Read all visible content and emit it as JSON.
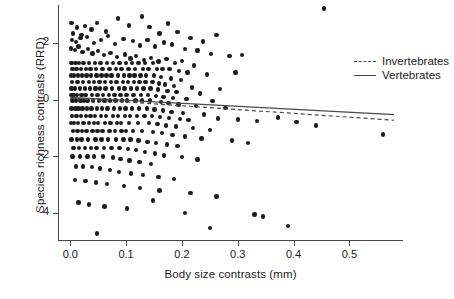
{
  "chart_data": {
    "type": "scatter",
    "title": "",
    "xlabel": "Body size contrasts (mm)",
    "ylabel": "Species richness contrasts (RRD)",
    "xlim": [
      -0.022,
      0.596
    ],
    "ylim": [
      -4.95,
      3.35
    ],
    "xticks": [
      0.0,
      0.1,
      0.2,
      0.3,
      0.4,
      0.5
    ],
    "xtick_labels": [
      "0.0",
      "0.1",
      "0.2",
      "0.3",
      "0.4",
      "0.5"
    ],
    "yticks": [
      2,
      0,
      -2,
      -4
    ],
    "ytick_labels": [
      "2",
      "0",
      "-2",
      "-4"
    ],
    "grid": false,
    "legend_position": "top-right",
    "point_color": "#1c1c1c",
    "axis_color": "#4a4a4a",
    "legend": [
      {
        "name": "Invertebrates",
        "style": "dashed"
      },
      {
        "name": "Vertebrates",
        "style": "solid"
      }
    ],
    "series": [
      {
        "name": "Invertebrates",
        "type": "line",
        "style": "dashed",
        "x": [
          0.0,
          0.58
        ],
        "y": [
          0.06,
          -0.72
        ]
      },
      {
        "name": "Vertebrates",
        "type": "line",
        "style": "solid",
        "x": [
          0.0,
          0.58
        ],
        "y": [
          0.09,
          -0.52
        ]
      }
    ],
    "points": [
      [
        0.002,
        2.72
      ],
      [
        0.012,
        2.55
      ],
      [
        0.026,
        2.6
      ],
      [
        0.038,
        2.48
      ],
      [
        0.005,
        2.35
      ],
      [
        0.02,
        2.3
      ],
      [
        0.048,
        2.72
      ],
      [
        0.064,
        2.41
      ],
      [
        0.086,
        2.88
      ],
      [
        0.105,
        2.62
      ],
      [
        0.128,
        2.95
      ],
      [
        0.142,
        2.57
      ],
      [
        0.16,
        2.35
      ],
      [
        0.175,
        2.7
      ],
      [
        0.192,
        2.4
      ],
      [
        0.215,
        2.18
      ],
      [
        0.238,
        2.06
      ],
      [
        0.262,
        2.3
      ],
      [
        0.455,
        3.22
      ],
      [
        0.003,
        2.12
      ],
      [
        0.01,
        2.05
      ],
      [
        0.018,
        2.18
      ],
      [
        0.03,
        2.22
      ],
      [
        0.042,
        2.0
      ],
      [
        0.055,
        2.12
      ],
      [
        0.068,
        2.26
      ],
      [
        0.08,
        1.98
      ],
      [
        0.095,
        2.14
      ],
      [
        0.112,
        2.08
      ],
      [
        0.125,
        1.92
      ],
      [
        0.138,
        2.12
      ],
      [
        0.152,
        1.88
      ],
      [
        0.168,
        2.02
      ],
      [
        0.182,
        1.96
      ],
      [
        0.205,
        1.8
      ],
      [
        0.228,
        1.74
      ],
      [
        0.252,
        1.62
      ],
      [
        0.285,
        1.55
      ],
      [
        0.308,
        1.58
      ],
      [
        0.001,
        1.82
      ],
      [
        0.008,
        1.76
      ],
      [
        0.015,
        1.88
      ],
      [
        0.022,
        1.7
      ],
      [
        0.032,
        1.8
      ],
      [
        0.04,
        1.64
      ],
      [
        0.05,
        1.72
      ],
      [
        0.06,
        1.58
      ],
      [
        0.072,
        1.66
      ],
      [
        0.084,
        1.52
      ],
      [
        0.098,
        1.6
      ],
      [
        0.108,
        1.46
      ],
      [
        0.118,
        1.55
      ],
      [
        0.132,
        1.4
      ],
      [
        0.145,
        1.48
      ],
      [
        0.158,
        1.36
      ],
      [
        0.172,
        1.44
      ],
      [
        0.188,
        1.3
      ],
      [
        0.2,
        1.38
      ],
      [
        0.222,
        1.22
      ],
      [
        0.002,
        1.3
      ],
      [
        0.009,
        1.3
      ],
      [
        0.016,
        1.3
      ],
      [
        0.024,
        1.3
      ],
      [
        0.034,
        1.3
      ],
      [
        0.044,
        1.3
      ],
      [
        0.054,
        1.3
      ],
      [
        0.066,
        1.3
      ],
      [
        0.076,
        1.3
      ],
      [
        0.088,
        1.3
      ],
      [
        0.1,
        1.3
      ],
      [
        0.11,
        1.3
      ],
      [
        0.122,
        1.3
      ],
      [
        0.134,
        1.3
      ],
      [
        0.148,
        1.3
      ],
      [
        0.004,
        1.08
      ],
      [
        0.011,
        1.08
      ],
      [
        0.019,
        1.08
      ],
      [
        0.028,
        1.08
      ],
      [
        0.036,
        1.08
      ],
      [
        0.046,
        1.08
      ],
      [
        0.058,
        1.08
      ],
      [
        0.07,
        1.08
      ],
      [
        0.082,
        1.08
      ],
      [
        0.092,
        1.08
      ],
      [
        0.104,
        1.08
      ],
      [
        0.116,
        1.08
      ],
      [
        0.13,
        1.08
      ],
      [
        0.14,
        1.08
      ],
      [
        0.155,
        1.08
      ],
      [
        0.165,
        1.08
      ],
      [
        0.178,
        1.08
      ],
      [
        0.195,
        1.02
      ],
      [
        0.21,
        0.96
      ],
      [
        0.245,
        0.9
      ],
      [
        0.001,
        0.86
      ],
      [
        0.007,
        0.86
      ],
      [
        0.014,
        0.86
      ],
      [
        0.021,
        0.86
      ],
      [
        0.029,
        0.86
      ],
      [
        0.037,
        0.86
      ],
      [
        0.047,
        0.86
      ],
      [
        0.056,
        0.86
      ],
      [
        0.065,
        0.86
      ],
      [
        0.074,
        0.86
      ],
      [
        0.085,
        0.86
      ],
      [
        0.096,
        0.86
      ],
      [
        0.106,
        0.86
      ],
      [
        0.115,
        0.86
      ],
      [
        0.126,
        0.86
      ],
      [
        0.136,
        0.86
      ],
      [
        0.15,
        0.86
      ],
      [
        0.163,
        0.8
      ],
      [
        0.18,
        0.76
      ],
      [
        0.198,
        0.7
      ],
      [
        0.003,
        0.62
      ],
      [
        0.013,
        0.62
      ],
      [
        0.023,
        0.62
      ],
      [
        0.033,
        0.62
      ],
      [
        0.043,
        0.62
      ],
      [
        0.052,
        0.62
      ],
      [
        0.062,
        0.62
      ],
      [
        0.073,
        0.62
      ],
      [
        0.083,
        0.62
      ],
      [
        0.094,
        0.62
      ],
      [
        0.103,
        0.62
      ],
      [
        0.114,
        0.62
      ],
      [
        0.124,
        0.62
      ],
      [
        0.135,
        0.62
      ],
      [
        0.147,
        0.62
      ],
      [
        0.159,
        0.58
      ],
      [
        0.17,
        0.54
      ],
      [
        0.186,
        0.5
      ],
      [
        0.218,
        0.44
      ],
      [
        0.268,
        0.38
      ],
      [
        0.002,
        0.4
      ],
      [
        0.008,
        0.4
      ],
      [
        0.017,
        0.4
      ],
      [
        0.026,
        0.4
      ],
      [
        0.035,
        0.4
      ],
      [
        0.045,
        0.4
      ],
      [
        0.053,
        0.4
      ],
      [
        0.063,
        0.4
      ],
      [
        0.075,
        0.4
      ],
      [
        0.087,
        0.4
      ],
      [
        0.097,
        0.4
      ],
      [
        0.109,
        0.4
      ],
      [
        0.12,
        0.4
      ],
      [
        0.131,
        0.4
      ],
      [
        0.144,
        0.4
      ],
      [
        0.157,
        0.36
      ],
      [
        0.174,
        0.32
      ],
      [
        0.19,
        0.28
      ],
      [
        0.232,
        0.22
      ],
      [
        0.296,
        0.96
      ],
      [
        0.001,
        0.18
      ],
      [
        0.006,
        0.18
      ],
      [
        0.012,
        0.18
      ],
      [
        0.02,
        0.18
      ],
      [
        0.027,
        0.18
      ],
      [
        0.039,
        0.18
      ],
      [
        0.049,
        0.18
      ],
      [
        0.059,
        0.18
      ],
      [
        0.069,
        0.18
      ],
      [
        0.079,
        0.18
      ],
      [
        0.09,
        0.18
      ],
      [
        0.101,
        0.18
      ],
      [
        0.113,
        0.18
      ],
      [
        0.127,
        0.18
      ],
      [
        0.139,
        0.18
      ],
      [
        0.153,
        0.14
      ],
      [
        0.167,
        0.1
      ],
      [
        0.184,
        0.06
      ],
      [
        0.208,
        0.02
      ],
      [
        0.255,
        -0.04
      ],
      [
        0.004,
        -0.02
      ],
      [
        0.01,
        -0.02
      ],
      [
        0.018,
        -0.02
      ],
      [
        0.025,
        -0.02
      ],
      [
        0.031,
        -0.02
      ],
      [
        0.041,
        -0.02
      ],
      [
        0.051,
        -0.02
      ],
      [
        0.061,
        -0.02
      ],
      [
        0.071,
        -0.02
      ],
      [
        0.081,
        -0.02
      ],
      [
        0.093,
        -0.02
      ],
      [
        0.102,
        -0.02
      ],
      [
        0.117,
        -0.02
      ],
      [
        0.129,
        -0.02
      ],
      [
        0.143,
        -0.02
      ],
      [
        0.162,
        -0.08
      ],
      [
        0.176,
        -0.12
      ],
      [
        0.194,
        -0.16
      ],
      [
        0.225,
        -0.22
      ],
      [
        0.278,
        -0.28
      ],
      [
        0.002,
        -0.3
      ],
      [
        0.009,
        -0.3
      ],
      [
        0.015,
        -0.3
      ],
      [
        0.022,
        -0.3
      ],
      [
        0.03,
        -0.3
      ],
      [
        0.038,
        -0.3
      ],
      [
        0.048,
        -0.3
      ],
      [
        0.057,
        -0.3
      ],
      [
        0.067,
        -0.3
      ],
      [
        0.078,
        -0.3
      ],
      [
        0.089,
        -0.3
      ],
      [
        0.099,
        -0.3
      ],
      [
        0.111,
        -0.3
      ],
      [
        0.123,
        -0.3
      ],
      [
        0.137,
        -0.3
      ],
      [
        0.151,
        -0.34
      ],
      [
        0.166,
        -0.38
      ],
      [
        0.181,
        -0.42
      ],
      [
        0.202,
        -0.46
      ],
      [
        0.24,
        -0.52
      ],
      [
        0.003,
        -0.56
      ],
      [
        0.011,
        -0.56
      ],
      [
        0.019,
        -0.56
      ],
      [
        0.028,
        -0.56
      ],
      [
        0.036,
        -0.56
      ],
      [
        0.044,
        -0.56
      ],
      [
        0.055,
        -0.56
      ],
      [
        0.064,
        -0.56
      ],
      [
        0.077,
        -0.56
      ],
      [
        0.086,
        -0.56
      ],
      [
        0.098,
        -0.56
      ],
      [
        0.107,
        -0.56
      ],
      [
        0.119,
        -0.56
      ],
      [
        0.133,
        -0.56
      ],
      [
        0.146,
        -0.56
      ],
      [
        0.161,
        -0.6
      ],
      [
        0.177,
        -0.64
      ],
      [
        0.196,
        -0.68
      ],
      [
        0.212,
        -0.72
      ],
      [
        0.265,
        -0.66
      ],
      [
        0.3,
        -0.7
      ],
      [
        0.335,
        -0.74
      ],
      [
        0.372,
        -0.62
      ],
      [
        0.405,
        -0.78
      ],
      [
        0.44,
        -0.9
      ],
      [
        0.001,
        -0.82
      ],
      [
        0.007,
        -0.82
      ],
      [
        0.014,
        -0.82
      ],
      [
        0.024,
        -0.82
      ],
      [
        0.033,
        -0.82
      ],
      [
        0.042,
        -0.82
      ],
      [
        0.05,
        -0.82
      ],
      [
        0.062,
        -0.82
      ],
      [
        0.072,
        -0.82
      ],
      [
        0.084,
        -0.82
      ],
      [
        0.091,
        -0.82
      ],
      [
        0.105,
        -0.82
      ],
      [
        0.121,
        -0.82
      ],
      [
        0.141,
        -0.82
      ],
      [
        0.156,
        -0.86
      ],
      [
        0.171,
        -0.9
      ],
      [
        0.189,
        -0.94
      ],
      [
        0.22,
        -1.0
      ],
      [
        0.25,
        -1.06
      ],
      [
        0.56,
        -1.22
      ],
      [
        0.005,
        -1.1
      ],
      [
        0.013,
        -1.1
      ],
      [
        0.021,
        -1.1
      ],
      [
        0.029,
        -1.1
      ],
      [
        0.04,
        -1.1
      ],
      [
        0.049,
        -1.1
      ],
      [
        0.058,
        -1.1
      ],
      [
        0.07,
        -1.1
      ],
      [
        0.08,
        -1.1
      ],
      [
        0.092,
        -1.1
      ],
      [
        0.1,
        -1.1
      ],
      [
        0.112,
        -1.1
      ],
      [
        0.128,
        -1.1
      ],
      [
        0.148,
        -1.14
      ],
      [
        0.164,
        -1.18
      ],
      [
        0.183,
        -1.24
      ],
      [
        0.205,
        -1.3
      ],
      [
        0.235,
        -1.36
      ],
      [
        0.29,
        -1.44
      ],
      [
        0.318,
        -1.52
      ],
      [
        0.002,
        -1.4
      ],
      [
        0.012,
        -1.4
      ],
      [
        0.02,
        -1.4
      ],
      [
        0.032,
        -1.4
      ],
      [
        0.045,
        -1.4
      ],
      [
        0.056,
        -1.4
      ],
      [
        0.068,
        -1.4
      ],
      [
        0.082,
        -1.4
      ],
      [
        0.095,
        -1.4
      ],
      [
        0.108,
        -1.4
      ],
      [
        0.122,
        -1.44
      ],
      [
        0.138,
        -1.48
      ],
      [
        0.154,
        -1.52
      ],
      [
        0.173,
        -1.58
      ],
      [
        0.192,
        -1.64
      ],
      [
        0.006,
        -1.7
      ],
      [
        0.016,
        -1.7
      ],
      [
        0.026,
        -1.7
      ],
      [
        0.037,
        -1.7
      ],
      [
        0.047,
        -1.7
      ],
      [
        0.06,
        -1.7
      ],
      [
        0.074,
        -1.7
      ],
      [
        0.088,
        -1.7
      ],
      [
        0.103,
        -1.74
      ],
      [
        0.118,
        -1.78
      ],
      [
        0.134,
        -1.84
      ],
      [
        0.152,
        -1.9
      ],
      [
        0.168,
        -1.96
      ],
      [
        0.2,
        -2.02
      ],
      [
        0.228,
        -2.1
      ],
      [
        0.004,
        -2.0
      ],
      [
        0.017,
        -2.0
      ],
      [
        0.031,
        -2.0
      ],
      [
        0.043,
        -2.0
      ],
      [
        0.059,
        -2.0
      ],
      [
        0.076,
        -2.04
      ],
      [
        0.09,
        -2.08
      ],
      [
        0.106,
        -2.14
      ],
      [
        0.124,
        -2.2
      ],
      [
        0.145,
        -2.26
      ],
      [
        0.01,
        -2.35
      ],
      [
        0.023,
        -2.35
      ],
      [
        0.039,
        -2.38
      ],
      [
        0.053,
        -2.42
      ],
      [
        0.071,
        -2.48
      ],
      [
        0.087,
        -2.54
      ],
      [
        0.109,
        -2.6
      ],
      [
        0.13,
        -2.66
      ],
      [
        0.158,
        -2.72
      ],
      [
        0.186,
        -2.8
      ],
      [
        0.008,
        -2.82
      ],
      [
        0.027,
        -2.86
      ],
      [
        0.046,
        -2.92
      ],
      [
        0.066,
        -2.98
      ],
      [
        0.096,
        -3.04
      ],
      [
        0.125,
        -3.12
      ],
      [
        0.16,
        -3.2
      ],
      [
        0.215,
        -3.3
      ],
      [
        0.262,
        -3.42
      ],
      [
        0.148,
        -3.55
      ],
      [
        0.015,
        -3.62
      ],
      [
        0.034,
        -3.7
      ],
      [
        0.061,
        -3.76
      ],
      [
        0.102,
        -3.84
      ],
      [
        0.205,
        -4.0
      ],
      [
        0.33,
        -4.05
      ],
      [
        0.345,
        -4.12
      ],
      [
        0.39,
        -4.45
      ],
      [
        0.25,
        -4.52
      ],
      [
        0.048,
        -4.72
      ]
    ]
  }
}
